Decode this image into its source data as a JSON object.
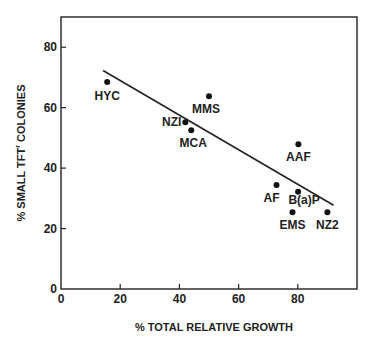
{
  "chart_data": {
    "type": "scatter",
    "title": "",
    "xlabel": "% TOTAL RELATIVE GROWTH",
    "ylabel": "% SMALL TFT",
    "ylabel_superscript": "r",
    "ylabel_suffix": " COLONIES",
    "xlim": [
      0,
      100
    ],
    "ylim": [
      0,
      90
    ],
    "xticks": [
      0,
      20,
      40,
      60,
      80
    ],
    "yticks": [
      0,
      20,
      40,
      60,
      80
    ],
    "xtick_labels": [
      "0",
      "20",
      "40",
      "60",
      "80"
    ],
    "ytick_labels": [
      "0",
      "20",
      "40",
      "60",
      "80"
    ],
    "grid": false,
    "legend": "none",
    "points": [
      {
        "label": "HYC",
        "x": 15.6,
        "y": 68.5
      },
      {
        "label": "MMS",
        "x": 50.0,
        "y": 63.8
      },
      {
        "label": "NZI",
        "x": 42.0,
        "y": 55.2
      },
      {
        "label": "MCA",
        "x": 44.0,
        "y": 52.5
      },
      {
        "label": "AAF",
        "x": 80.2,
        "y": 47.9
      },
      {
        "label": "AF",
        "x": 72.8,
        "y": 34.4
      },
      {
        "label": "B(a)P",
        "x": 80.1,
        "y": 32.2
      },
      {
        "label": "EMS",
        "x": 78.2,
        "y": 25.4
      },
      {
        "label": "NZ2",
        "x": 90.0,
        "y": 25.4
      }
    ],
    "regression_line": {
      "x": [
        14.2,
        92.1
      ],
      "y": [
        72.3,
        27.7
      ]
    }
  },
  "colors": {
    "ink": "#222222",
    "background": "#ffffff"
  }
}
